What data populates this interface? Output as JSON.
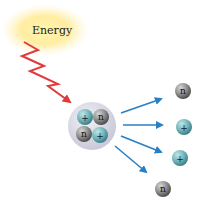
{
  "diagram": {
    "energy_label": "Energy",
    "proton_symbol": "+",
    "neutron_symbol": "n",
    "colors": {
      "glow": "#fff3a0",
      "lightning": "#e03a3a",
      "arrow": "#2a7fc4",
      "proton": "#6fb3b8",
      "neutron": "#7a7a7a",
      "nucleus_shell": "#d8d8e4"
    },
    "nucleus": {
      "particles": [
        "proton",
        "neutron",
        "neutron",
        "proton"
      ]
    },
    "emitted": [
      "neutron",
      "proton",
      "proton",
      "neutron"
    ]
  }
}
